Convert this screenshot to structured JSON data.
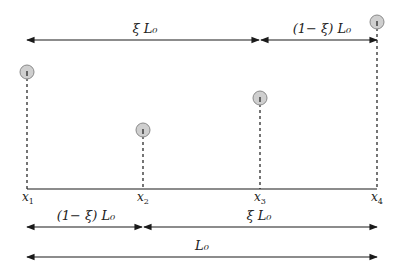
{
  "figure": {
    "colors": {
      "line": "#1a1a1a",
      "ball_fill": "#cfcfcf",
      "ball_stroke": "#8a8a8a",
      "text": "#222222"
    }
  },
  "points": [
    {
      "label": "x",
      "sub": "1",
      "x": 27,
      "ball_y": 72
    },
    {
      "label": "x",
      "sub": "2",
      "x": 143,
      "ball_y": 130
    },
    {
      "label": "x",
      "sub": "3",
      "x": 260,
      "ball_y": 98
    },
    {
      "label": "x",
      "sub": "4",
      "x": 377,
      "ball_y": 22
    }
  ],
  "top_arrows": {
    "left_label": "ξ L₀",
    "right_label": "(1− ξ) L₀"
  },
  "bottom_arrows": {
    "row1_left_label": "(1− ξ) L₀",
    "row1_right_label": "ξ L₀",
    "row2_label": "L₀"
  }
}
